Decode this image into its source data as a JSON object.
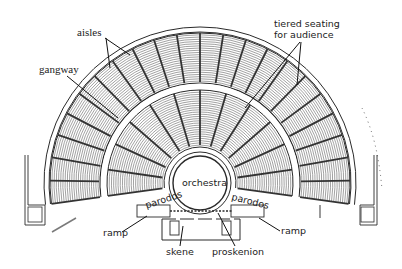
{
  "diagram": {
    "colors": {
      "ink": "#2a2a2a",
      "hatch": "#7a7a7a",
      "paper": "#ffffff",
      "aisle": "#333333"
    },
    "geometry": {
      "center": [
        200,
        183
      ],
      "orchestra_r": 27,
      "orchestra_ring_r": 31,
      "inner_seating": [
        36,
        93
      ],
      "gangway": [
        94,
        100
      ],
      "outer_seating": [
        101,
        150
      ],
      "outer_wall": [
        151,
        156
      ],
      "inner_aisle_count": 12,
      "outer_aisle_count": 22,
      "sweep_deg": [
        -8,
        188
      ]
    },
    "labels": {
      "aisles": "aisles",
      "gangway": "gangway",
      "tiered_seating_line1": "tiered seating",
      "tiered_seating_line2": "for audience",
      "orchestra": "orchestra",
      "parodos_left": "parodos",
      "parodos_right": "parodos",
      "ramp_left": "ramp",
      "ramp_right": "ramp",
      "skene": "skene",
      "proskenion": "proskenion"
    }
  }
}
